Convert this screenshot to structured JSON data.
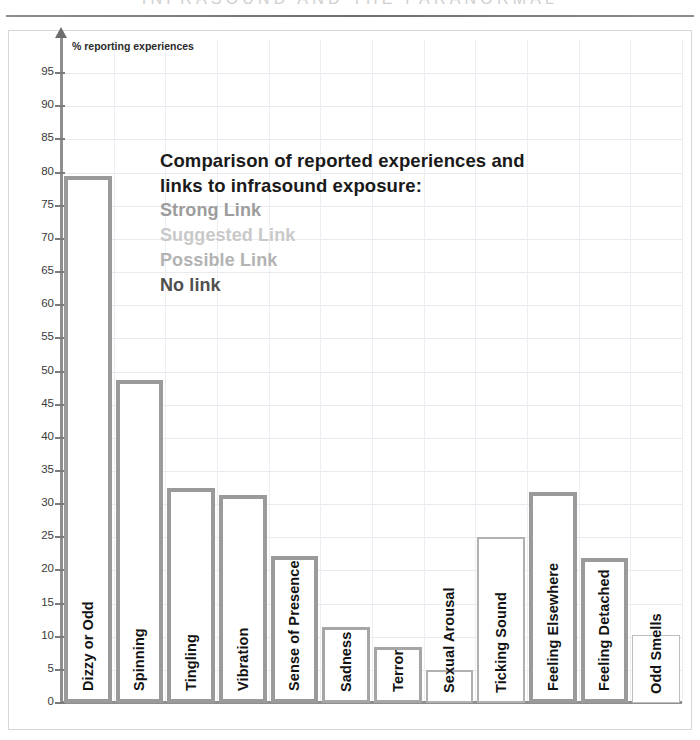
{
  "header": {
    "running_title": "INFRASOUND AND THE PARANORMAL"
  },
  "chart_data": {
    "type": "bar",
    "title": "",
    "axis_caption": "% reporting experiences",
    "xlabel": "",
    "ylabel": "% reporting experiences",
    "ylim": [
      0,
      100
    ],
    "ytick_step": 5,
    "yticks": [
      0,
      5,
      10,
      15,
      20,
      25,
      30,
      35,
      40,
      45,
      50,
      55,
      60,
      65,
      70,
      75,
      80,
      85,
      90,
      95
    ],
    "ytick_labels": [
      "0",
      "5",
      "10",
      "15",
      "20",
      "25",
      "30",
      "35",
      "40",
      "45",
      "50",
      "55",
      "60",
      "65",
      "70",
      "75",
      "80",
      "85",
      "90",
      "95"
    ],
    "grid": true,
    "legend_position": "inside-upper-center",
    "categories": [
      "Dizzy or Odd",
      "Spinning",
      "Tingling",
      "Vibration",
      "Sense of Presence",
      "Sadness",
      "Terror",
      "Sexual Arousal",
      "Ticking Sound",
      "Feeling Elsewhere",
      "Feeling Detached",
      "Odd Smells"
    ],
    "values": [
      79.5,
      48.7,
      32.5,
      31.3,
      22.2,
      11.4,
      8.5,
      5.0,
      25.0,
      31.9,
      21.8,
      10.3
    ],
    "link_class": [
      "link-strong",
      "link-strong",
      "link-strong",
      "link-strong",
      "link-strong",
      "link-suggested",
      "link-suggested",
      "link-possible",
      "link-possible",
      "link-strong",
      "link-strong",
      "link-none"
    ]
  },
  "legend": {
    "title_line1": "Comparison of reported experiences and",
    "title_line2": "links to infrasound exposure:",
    "items": [
      {
        "label": "Strong Link",
        "color": "#9d9d9d"
      },
      {
        "label": "Suggested Link",
        "color": "#c9c9c9"
      },
      {
        "label": "Possible Link",
        "color": "#b3b3b3"
      },
      {
        "label": "No link",
        "color": "#4f4f4f"
      }
    ]
  }
}
